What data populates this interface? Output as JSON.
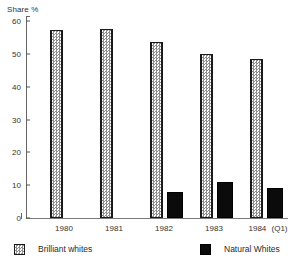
{
  "chart_data": {
    "type": "bar",
    "title": "",
    "xlabel": "",
    "ylabel": "Share %",
    "ylim": [
      0,
      60
    ],
    "yticks": [
      0,
      10,
      20,
      30,
      40,
      50,
      60
    ],
    "grid": false,
    "legend_position": "bottom",
    "categories": [
      "1980",
      "1981",
      "1982",
      "1983",
      "1984"
    ],
    "category_qualifiers": [
      "",
      "",
      "",
      "",
      "(Q1)"
    ],
    "series": [
      {
        "name": "Brilliant whites",
        "values": [
          57.3,
          57.5,
          53.5,
          50.0,
          48.3
        ],
        "swatch": "hatched-light"
      },
      {
        "name": "Natural Whites",
        "values": [
          0,
          0,
          8.0,
          11.0,
          9.0
        ],
        "swatch": "solid-black"
      }
    ]
  },
  "axis": {
    "y_title": "Share %",
    "ticks": [
      "60",
      "50",
      "40",
      "30",
      "20",
      "10",
      "0"
    ]
  },
  "legend": {
    "items": [
      {
        "label": "Brilliant whites"
      },
      {
        "label": "Natural Whites"
      }
    ]
  },
  "colors": {
    "bar_brilliant": "#e9e9e9",
    "bar_natural": "#0b0b0b",
    "axis": "#666666",
    "text": "#333333",
    "background": "#ffffff"
  }
}
